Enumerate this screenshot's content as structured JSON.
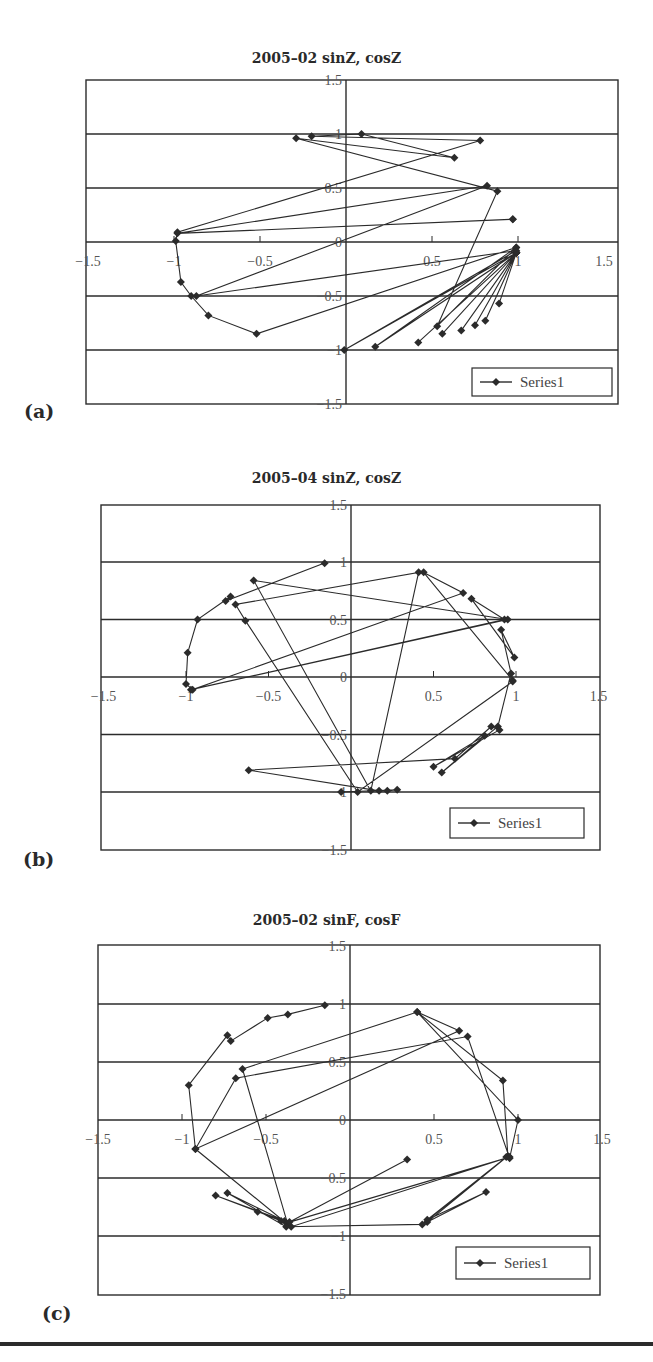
{
  "chart_data": [
    {
      "panel_label": "(a)",
      "type": "line",
      "title": "2005–02 sinZ, cosZ",
      "xlabel": "",
      "ylabel": "",
      "xlim": [
        -1.5,
        1.5
      ],
      "ylim": [
        -1.5,
        1.5
      ],
      "x_ticks": [
        "-1.5",
        "-0.5",
        "0",
        "0.5",
        "1",
        "1.5"
      ],
      "x_tick_labels_shown": [
        "−1.5",
        "−1",
        "−0.5",
        "0",
        "0.5",
        "1",
        "1.5"
      ],
      "y_tick_labels": [
        "1.5",
        "1",
        "0.5",
        "0",
        "−0.5",
        "−1",
        "−1.5"
      ],
      "grid": "horizontal",
      "legend": {
        "entries": [
          "Series1"
        ],
        "position": "lower right"
      },
      "series": [
        {
          "name": "Series1",
          "marker": "diamond",
          "x": [
            0.99,
            0.53,
            0.88,
            -0.29,
            0.63,
            0.09,
            -0.2,
            0.78,
            -0.98,
            -0.99,
            -0.96,
            -0.9,
            -0.8,
            -0.52,
            0.99,
            0.17,
            0.99,
            0.42,
            0.99,
            0.56,
            0.99,
            0.67,
            0.99,
            0.75,
            0.99,
            0.81,
            0.99,
            0.89,
            0.99,
            -0.01,
            0.99,
            -0.87,
            0.82,
            -0.98,
            0.97,
            0.97
          ],
          "y": [
            -0.05,
            -0.78,
            0.47,
            0.96,
            0.78,
            1.0,
            0.98,
            0.94,
            0.09,
            0.01,
            -0.37,
            -0.5,
            -0.68,
            -0.85,
            -0.05,
            -0.97,
            -0.1,
            -0.93,
            -0.1,
            -0.85,
            -0.1,
            -0.82,
            -0.1,
            -0.77,
            -0.1,
            -0.73,
            -0.1,
            -0.57,
            -0.1,
            -1.0,
            -0.08,
            -0.5,
            0.52,
            0.08,
            0.21,
            0.21
          ]
        }
      ]
    },
    {
      "panel_label": "(b)",
      "type": "line",
      "title": "2005–04 sinZ, cosZ",
      "xlabel": "",
      "ylabel": "",
      "xlim": [
        -1.5,
        1.5
      ],
      "ylim": [
        -1.5,
        1.5
      ],
      "x_tick_labels_shown": [
        "−1.5",
        "−1",
        "−0.5",
        "0",
        "0.5",
        "1",
        "1.5"
      ],
      "y_tick_labels": [
        "1.5",
        "1",
        "0.5",
        "0",
        "−0.5",
        "−1",
        "−1.5"
      ],
      "grid": "horizontal",
      "legend": {
        "entries": [
          "Series1"
        ],
        "position": "lower right"
      },
      "series": [
        {
          "name": "Series1",
          "marker": "diamond",
          "x": [
            -0.16,
            -0.76,
            -0.73,
            -0.93,
            -0.99,
            -1.0,
            -0.96,
            0.68,
            0.44,
            0.98,
            0.91,
            0.99,
            0.73,
            0.93,
            -0.97,
            0.95,
            -0.59,
            0.12,
            0.41,
            -0.7,
            -0.64,
            0.04,
            0.98,
            0.97,
            0.89,
            0.55,
            0.81,
            0.5,
            0.9,
            0.85,
            0.63,
            -0.62,
            0.17,
            0.22,
            0.28,
            -0.06
          ],
          "y": [
            0.99,
            0.66,
            0.7,
            0.5,
            0.21,
            -0.06,
            -0.11,
            0.73,
            0.91,
            -0.03,
            0.41,
            0.17,
            0.68,
            0.5,
            -0.11,
            0.5,
            0.84,
            -0.99,
            0.91,
            0.63,
            0.49,
            -1.0,
            -0.04,
            0.03,
            -0.43,
            -0.83,
            -0.51,
            -0.78,
            -0.46,
            -0.43,
            -0.71,
            -0.81,
            -0.99,
            -0.99,
            -0.98,
            -1.0
          ]
        }
      ]
    },
    {
      "panel_label": "(c)",
      "type": "line",
      "title": "2005–02 sinF, cosF",
      "xlabel": "",
      "ylabel": "",
      "xlim": [
        -1.5,
        1.5
      ],
      "ylim": [
        -1.5,
        1.5
      ],
      "x_tick_labels_shown": [
        "−1.5",
        "−1",
        "−0.5",
        "0",
        "0.5",
        "1",
        "1.5"
      ],
      "y_tick_labels": [
        "1.5",
        "1",
        "0.5",
        "0",
        "−0.5",
        "−1",
        "−1.5"
      ],
      "grid": "horizontal",
      "legend": {
        "entries": [
          "Series1"
        ],
        "position": "lower right"
      },
      "series": [
        {
          "name": "Series1",
          "marker": "diamond",
          "x": [
            -0.15,
            -0.37,
            -0.49,
            -0.71,
            -0.73,
            -0.96,
            -0.92,
            0.65,
            0.4,
            1.0,
            0.95,
            0.7,
            -0.68,
            -0.92,
            -0.37,
            -0.64,
            0.4,
            0.91,
            0.94,
            0.46,
            0.81,
            0.46,
            0.93,
            0.43,
            -0.38,
            -0.73,
            -0.39,
            -0.8,
            -0.55,
            -0.41,
            -0.35,
            0.95,
            -0.36,
            0.34
          ],
          "y": [
            0.99,
            0.91,
            0.88,
            0.68,
            0.73,
            0.3,
            -0.25,
            0.77,
            0.93,
            0.0,
            -0.33,
            0.72,
            0.36,
            -0.25,
            -0.9,
            0.44,
            0.93,
            0.34,
            -0.31,
            -0.88,
            -0.62,
            -0.86,
            -0.32,
            -0.9,
            -0.92,
            -0.63,
            -0.87,
            -0.65,
            -0.79,
            -0.87,
            -0.92,
            -0.32,
            -0.88,
            -0.34
          ]
        }
      ]
    }
  ],
  "panels": [
    {
      "label": "(a)",
      "title": "2005–02 sinZ, cosZ",
      "legend": "Series1"
    },
    {
      "label": "(b)",
      "title": "2005–04 sinZ, cosZ",
      "legend": "Series1"
    },
    {
      "label": "(c)",
      "title": "2005–02 sinF, cosF",
      "legend": "Series1"
    }
  ],
  "axis_ticks": {
    "x": [
      "−1.5",
      "−1",
      "−0.5",
      "0",
      "0.5",
      "1",
      "1.5"
    ],
    "y": [
      "1.5",
      "1",
      "0.5",
      "0",
      "−0.5",
      "−1",
      "−1.5"
    ]
  },
  "colors": {
    "ink": "#2b2b2b",
    "tick_text": "#555555",
    "background": "#ffffff"
  }
}
